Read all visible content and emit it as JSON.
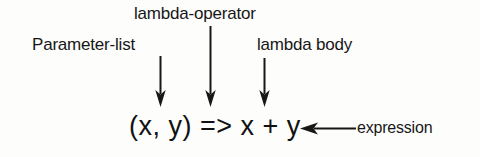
{
  "figure": {
    "background_color": "#fdfdfc",
    "ink_color": "#171717",
    "code": {
      "text": "(x, y) => x + y",
      "parts": {
        "parameter_list": "(x, y)",
        "lambda_operator": "=>",
        "lambda_body": "x + y"
      }
    },
    "annotations": {
      "parameter_list": "Parameter-list",
      "lambda_operator": "lambda-operator",
      "lambda_body": "lambda body",
      "expression": "expression"
    },
    "arrows": {
      "parameter_list_arrow": "arrow-down-icon",
      "lambda_operator_arrow": "arrow-down-icon",
      "lambda_body_arrow": "arrow-down-icon",
      "expression_arrow": "arrow-left-icon"
    }
  }
}
